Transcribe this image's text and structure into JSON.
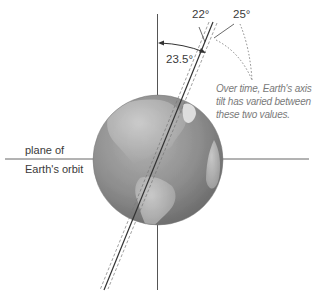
{
  "diagram": {
    "angles": {
      "current": "23.5°",
      "min": "22°",
      "max": "25°"
    },
    "orbit_label": {
      "line1": "plane of",
      "line2": "Earth's orbit"
    },
    "note": {
      "line1": "Over time, Earth's axis",
      "line2": "tilt has varied between",
      "line3": "these two values."
    },
    "colors": {
      "lines": "#555555",
      "globe_ocean": "#8c8c8c",
      "globe_land": "#b8b8b8",
      "note_text": "#7a7a7a"
    }
  }
}
